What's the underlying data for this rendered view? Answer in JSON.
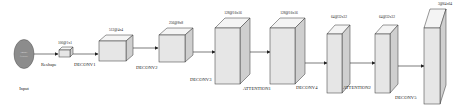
{
  "diagram": {
    "input": {
      "label": "Input",
      "inner_text_line1": "Image",
      "inner_text_line2": "feature",
      "fill": "#8c8c8c"
    },
    "edges": [
      {
        "label": "Reshape"
      },
      {
        "label": "DECONV1"
      },
      {
        "label": "DECONV2"
      },
      {
        "label": "DECONV3"
      },
      {
        "label": "ATTENTION1"
      },
      {
        "label": "DECONV4"
      },
      {
        "label": "ATTENTION2"
      },
      {
        "label": "DECONV5"
      }
    ],
    "blocks": [
      {
        "shape": "100@1x1"
      },
      {
        "shape": "512@4x4"
      },
      {
        "shape": "256@8x8"
      },
      {
        "shape": "128@16x16"
      },
      {
        "shape": "128@16x16"
      },
      {
        "shape": "64@32x32"
      },
      {
        "shape": "64@32x32"
      },
      {
        "shape": "3@64x64"
      }
    ]
  }
}
